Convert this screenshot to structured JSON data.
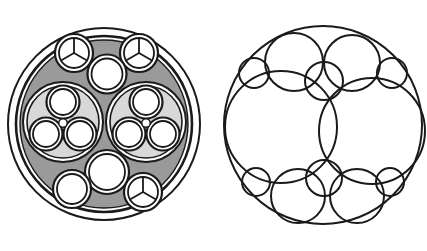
{
  "figure": {
    "background_color": "#ffffff",
    "stroke_color": "#1a1a1a",
    "width": 427,
    "height": 251,
    "panel_count": 2
  },
  "palette": {
    "background": "#ffffff",
    "outline": "#1a1a1a",
    "filler_gray": "#9a9a9a",
    "bundle_gray": "#d8d8d8",
    "core_white": "#ffffff",
    "sheath_white": "#ffffff"
  },
  "left_panel": {
    "name": "cable-cross-section",
    "label": "Cable cross-section with gray filler",
    "outer_jacket": {
      "cx": 104,
      "cy": 124,
      "r": 96,
      "stroke_width": 2.0,
      "fill": "#ffffff"
    },
    "inner_jacket": {
      "cx": 104,
      "cy": 124,
      "r": 88,
      "stroke_width": 2.6,
      "fill": "#ffffff"
    },
    "filler": {
      "cx": 104,
      "cy": 124,
      "r": 84,
      "fill": "#9a9a9a",
      "stroke_width": 1.4
    },
    "sub_bundles": [
      {
        "id": "bundle-left",
        "cx": 63,
        "cy": 122,
        "r_outer": 40,
        "r_inner": 36,
        "fill": "#d8d8d8",
        "cores": [
          {
            "id": "core-top",
            "cx": 63,
            "cy": 102,
            "r_outer": 16.5,
            "r_inner": 13.0
          },
          {
            "id": "core-bottom-left",
            "cx": 46,
            "cy": 134,
            "r_outer": 16.5,
            "r_inner": 13.0
          },
          {
            "id": "core-bottom-right",
            "cx": 80,
            "cy": 134,
            "r_outer": 16.5,
            "r_inner": 13.0
          }
        ],
        "center_filler": {
          "cx": 63,
          "cy": 123,
          "r": 4.2
        }
      },
      {
        "id": "bundle-right",
        "cx": 146,
        "cy": 122,
        "r_outer": 40,
        "r_inner": 36,
        "fill": "#d8d8d8",
        "cores": [
          {
            "id": "core-top",
            "cx": 146,
            "cy": 102,
            "r_outer": 16.5,
            "r_inner": 13.0
          },
          {
            "id": "core-bottom-left",
            "cx": 129,
            "cy": 134,
            "r_outer": 16.5,
            "r_inner": 13.0
          },
          {
            "id": "core-bottom-right",
            "cx": 163,
            "cy": 134,
            "r_outer": 16.5,
            "r_inner": 13.0
          }
        ],
        "center_filler": {
          "cx": 146,
          "cy": 123,
          "r": 4.2
        }
      }
    ],
    "trilobe_conductors": [
      {
        "id": "trilobe-top-left",
        "cx": 74,
        "cy": 53,
        "r_outer": 19,
        "r_inner": 15,
        "spokes": 3,
        "spoke_rotation_deg": 0
      },
      {
        "id": "trilobe-top-right",
        "cx": 139,
        "cy": 53,
        "r_outer": 19,
        "r_inner": 15,
        "spokes": 3,
        "spoke_rotation_deg": 0
      },
      {
        "id": "trilobe-bottom-right",
        "cx": 143,
        "cy": 192,
        "r_outer": 19,
        "r_inner": 15,
        "spokes": 3,
        "spoke_rotation_deg": 0
      }
    ],
    "plain_conductors": [
      {
        "id": "plain-top-center",
        "cx": 107,
        "cy": 74,
        "r_outer": 19.5,
        "r_inner": 15.5
      },
      {
        "id": "plain-bottom-center",
        "cx": 107,
        "cy": 172,
        "r_outer": 22.0,
        "r_inner": 18.0
      },
      {
        "id": "plain-bottom-left",
        "cx": 72,
        "cy": 189,
        "r_outer": 19.0,
        "r_inner": 15.0
      }
    ],
    "counts": {
      "sub_bundles": 2,
      "cores_per_bundle": 3,
      "trilobe_conductors": 3,
      "plain_conductors": 3
    }
  },
  "right_panel": {
    "name": "circle-packing",
    "label": "Apollonian-style circle packing",
    "stroke_width": 2.0,
    "outer_circle": {
      "id": "packing-boundary",
      "cx": 323,
      "cy": 125,
      "r": 99
    },
    "circles": [
      {
        "id": "large-left",
        "cx": 281,
        "cy": 127,
        "r": 56,
        "size_class": "large"
      },
      {
        "id": "large-right",
        "cx": 372,
        "cy": 131,
        "r": 53,
        "size_class": "large"
      },
      {
        "id": "medium-top-left",
        "cx": 294,
        "cy": 62,
        "r": 29,
        "size_class": "medium"
      },
      {
        "id": "medium-top-right",
        "cx": 352,
        "cy": 63,
        "r": 28,
        "size_class": "medium"
      },
      {
        "id": "medium-bot-left",
        "cx": 298,
        "cy": 196,
        "r": 27,
        "size_class": "medium"
      },
      {
        "id": "medium-bot-right",
        "cx": 357,
        "cy": 196,
        "r": 27,
        "size_class": "medium"
      },
      {
        "id": "small-top-center",
        "cx": 324,
        "cy": 81,
        "r": 19,
        "size_class": "small"
      },
      {
        "id": "small-bot-center",
        "cx": 324,
        "cy": 178,
        "r": 18,
        "size_class": "small"
      },
      {
        "id": "tiny-top-left",
        "cx": 254,
        "cy": 73,
        "r": 15,
        "size_class": "tiny"
      },
      {
        "id": "tiny-top-right",
        "cx": 392,
        "cy": 73,
        "r": 15,
        "size_class": "tiny"
      },
      {
        "id": "tiny-bot-left",
        "cx": 256,
        "cy": 182,
        "r": 14,
        "size_class": "tiny"
      },
      {
        "id": "tiny-bot-right",
        "cx": 390,
        "cy": 182,
        "r": 14,
        "size_class": "tiny"
      }
    ],
    "counts": {
      "boundary": 1,
      "large": 2,
      "medium": 4,
      "small": 2,
      "tiny": 4,
      "total_inner": 12
    }
  }
}
